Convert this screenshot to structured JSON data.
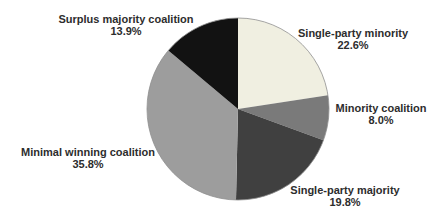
{
  "chart_data": {
    "type": "pie",
    "title": "",
    "legend": "none",
    "labels_position": "outside",
    "start_angle_deg": 0,
    "direction": "clockwise",
    "slices": [
      {
        "id": "single-party-minority",
        "label": "Single-party minority",
        "value": 22.6,
        "pct_label": "22.6%",
        "color": "#f0efe1"
      },
      {
        "id": "minority-coalition",
        "label": "Minority coalition",
        "value": 8.0,
        "pct_label": "8.0%",
        "color": "#7a7a7a"
      },
      {
        "id": "single-party-majority",
        "label": "Single-party majority",
        "value": 19.8,
        "pct_label": "19.8%",
        "color": "#404040"
      },
      {
        "id": "minimal-winning-coalition",
        "label": "Minimal winning coalition",
        "value": 35.8,
        "pct_label": "35.8%",
        "color": "#9d9d9d"
      },
      {
        "id": "surplus-majority-coalition",
        "label": "Surplus majority coalition",
        "value": 13.9,
        "pct_label": "13.9%",
        "color": "#121212"
      }
    ],
    "geometry": {
      "cx": 238,
      "cy": 109,
      "r": 91
    },
    "outline_color": "#8f8f8f"
  }
}
